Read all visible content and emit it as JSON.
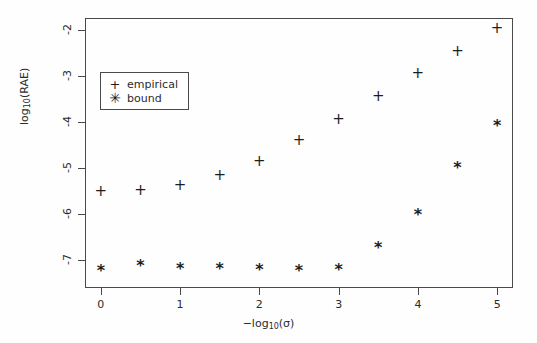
{
  "chart_data": {
    "type": "scatter",
    "title": "",
    "xlabel": "−log₁₀(σ)",
    "ylabel": "log₁₀(RAE)",
    "xlim": [
      -0.2,
      5.2
    ],
    "ylim": [
      -7.6,
      -1.75
    ],
    "xticks": [
      0,
      1,
      2,
      3,
      4,
      5
    ],
    "xtick_labels": [
      "0",
      "1",
      "2",
      "3",
      "4",
      "5"
    ],
    "yticks": [
      -2,
      -3,
      -4,
      -5,
      -6,
      -7
    ],
    "ytick_labels": [
      "-2",
      "-3",
      "-4",
      "-5",
      "-6",
      "-7"
    ],
    "grid": false,
    "legend_position": "upper-left-inside",
    "x": [
      0,
      0.5,
      1,
      1.5,
      2,
      2.5,
      3,
      3.5,
      4,
      4.5,
      5
    ],
    "series": [
      {
        "name": "empirical",
        "marker": "+",
        "values": [
          -5.5,
          -5.47,
          -5.37,
          -5.16,
          -4.84,
          -4.39,
          -3.94,
          -3.45,
          -2.95,
          -2.46,
          -1.97
        ]
      },
      {
        "name": "bound",
        "marker": "*",
        "values": [
          -7.23,
          -7.12,
          -7.18,
          -7.19,
          -7.21,
          -7.24,
          -7.22,
          -6.74,
          -6.01,
          -4.99,
          -4.09
        ]
      }
    ]
  },
  "legend": {
    "items": [
      {
        "symbol": "+",
        "label": "empirical"
      },
      {
        "symbol": "✳",
        "label": "bound"
      }
    ]
  }
}
